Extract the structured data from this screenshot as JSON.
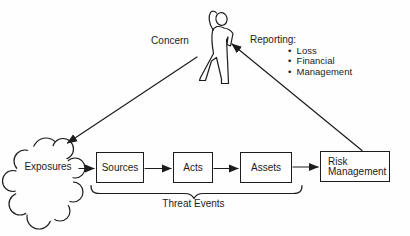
{
  "colors": {
    "ink": "#1c1c1c",
    "background": "#fefefe"
  },
  "person": {
    "icon": "concerned-person-figure",
    "label": "Concern"
  },
  "reporting": {
    "label": "Reporting:",
    "items": [
      "Loss",
      "Financial",
      "Management"
    ]
  },
  "exposures": {
    "shape": "cloud",
    "label": "Exposures"
  },
  "flow": {
    "boxes": [
      {
        "id": "sources",
        "label": "Sources"
      },
      {
        "id": "acts",
        "label": "Acts"
      },
      {
        "id": "assets",
        "label": "Assets"
      },
      {
        "id": "risk-management",
        "label": "Risk Management",
        "line1": "Risk",
        "line2": "Management"
      }
    ],
    "brace_label": "Threat Events"
  },
  "arrows": [
    "concern-to-exposures",
    "risk-management-to-person",
    "exposures-to-sources",
    "sources-to-acts",
    "acts-to-assets",
    "assets-to-risk-management"
  ]
}
